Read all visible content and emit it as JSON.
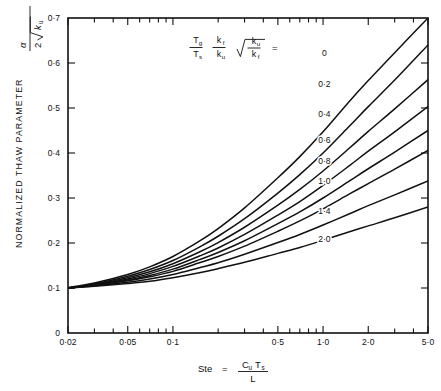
{
  "figure": {
    "yaxis_name": "NORMALIZED THAW PARAMETER",
    "yaxis_formula": {
      "numerator": "α",
      "denominator_coef": "2",
      "denominator_radicand": "k",
      "denominator_radicand_sub": "u"
    },
    "xaxis_caption": {
      "symbol": "Ste",
      "equals": "=",
      "numerator_a": "C",
      "numerator_a_sub": "u",
      "numerator_b": "T",
      "numerator_b_sub": "s",
      "denominator": "L"
    },
    "legend_formula": {
      "t_num": "T",
      "t_num_sub": "g",
      "t_den": "T",
      "t_den_sub": "s",
      "k_num": "k",
      "k_num_sub": "f",
      "k_den": "k",
      "k_den_sub": "u",
      "root_num": "k",
      "root_num_sub": "u",
      "root_den": "k",
      "root_den_sub": "f",
      "equals": "="
    }
  },
  "chart_data": {
    "type": "line",
    "title": "",
    "xlabel": "Ste = Cu Ts / L",
    "ylabel": "NORMALIZED THAW PARAMETER  α / (2√ku)",
    "xscale": "log",
    "xlim": [
      0.02,
      5.0
    ],
    "ylim": [
      0,
      0.7
    ],
    "grid": false,
    "legend_position": "inline-curve-labels",
    "xticks_labeled": [
      "0·02",
      "0·05",
      "0·1",
      "0·5",
      "1·0",
      "2·0",
      "5·0"
    ],
    "xticks_values": [
      0.02,
      0.05,
      0.1,
      0.5,
      1.0,
      2.0,
      5.0
    ],
    "xticks_minor": [
      0.03,
      0.04,
      0.06,
      0.07,
      0.08,
      0.09,
      0.2,
      0.3,
      0.4,
      0.6,
      0.7,
      0.8,
      0.9,
      3.0,
      4.0
    ],
    "yticks_labeled": [
      "0",
      "0·1",
      "0·2",
      "0·3",
      "0·4",
      "0·5",
      "0·6",
      "0·7"
    ],
    "yticks_values": [
      0,
      0.1,
      0.2,
      0.3,
      0.4,
      0.5,
      0.6,
      0.7
    ],
    "series": [
      {
        "name": "0",
        "label": "0",
        "label_x": 1.02,
        "label_y": 0.622,
        "x": [
          0.02,
          0.03,
          0.05,
          0.07,
          0.1,
          0.15,
          0.2,
          0.3,
          0.5,
          0.7,
          1.0,
          1.5,
          2.0,
          3.0,
          5.0
        ],
        "y": [
          0.101,
          0.111,
          0.13,
          0.147,
          0.17,
          0.204,
          0.232,
          0.278,
          0.345,
          0.392,
          0.447,
          0.515,
          0.561,
          0.623,
          0.7
        ]
      },
      {
        "name": "0.2",
        "label": "0·2",
        "label_x": 1.02,
        "label_y": 0.553,
        "x": [
          0.02,
          0.03,
          0.05,
          0.07,
          0.1,
          0.15,
          0.2,
          0.3,
          0.5,
          0.7,
          1.0,
          1.5,
          2.0,
          3.0,
          5.0
        ],
        "y": [
          0.1,
          0.109,
          0.126,
          0.141,
          0.161,
          0.191,
          0.215,
          0.254,
          0.311,
          0.352,
          0.4,
          0.46,
          0.503,
          0.562,
          0.64
        ]
      },
      {
        "name": "0.4",
        "label": "0·4",
        "label_x": 1.02,
        "label_y": 0.487,
        "x": [
          0.02,
          0.03,
          0.05,
          0.07,
          0.1,
          0.15,
          0.2,
          0.3,
          0.5,
          0.7,
          1.0,
          1.5,
          2.0,
          3.0,
          5.0
        ],
        "y": [
          0.1,
          0.108,
          0.123,
          0.136,
          0.154,
          0.18,
          0.201,
          0.235,
          0.284,
          0.319,
          0.36,
          0.411,
          0.448,
          0.498,
          0.563
        ]
      },
      {
        "name": "0.6",
        "label": "0·6",
        "label_x": 1.02,
        "label_y": 0.43,
        "x": [
          0.02,
          0.03,
          0.05,
          0.07,
          0.1,
          0.15,
          0.2,
          0.3,
          0.5,
          0.7,
          1.0,
          1.5,
          2.0,
          3.0,
          5.0
        ],
        "y": [
          0.1,
          0.107,
          0.12,
          0.132,
          0.148,
          0.171,
          0.189,
          0.219,
          0.262,
          0.292,
          0.328,
          0.372,
          0.404,
          0.447,
          0.503
        ]
      },
      {
        "name": "0.8",
        "label": "0·8",
        "label_x": 1.02,
        "label_y": 0.382,
        "x": [
          0.02,
          0.03,
          0.05,
          0.07,
          0.1,
          0.15,
          0.2,
          0.3,
          0.5,
          0.7,
          1.0,
          1.5,
          2.0,
          3.0,
          5.0
        ],
        "y": [
          0.1,
          0.106,
          0.118,
          0.128,
          0.142,
          0.163,
          0.179,
          0.205,
          0.243,
          0.269,
          0.3,
          0.338,
          0.365,
          0.402,
          0.45
        ]
      },
      {
        "name": "1.0",
        "label": "1·0",
        "label_x": 1.02,
        "label_y": 0.338,
        "x": [
          0.02,
          0.03,
          0.05,
          0.07,
          0.1,
          0.15,
          0.2,
          0.3,
          0.5,
          0.7,
          1.0,
          1.5,
          2.0,
          3.0,
          5.0
        ],
        "y": [
          0.1,
          0.106,
          0.116,
          0.125,
          0.137,
          0.156,
          0.17,
          0.193,
          0.226,
          0.249,
          0.276,
          0.309,
          0.332,
          0.364,
          0.406
        ]
      },
      {
        "name": "1.4",
        "label": "1·4",
        "label_x": 1.02,
        "label_y": 0.272,
        "x": [
          0.02,
          0.03,
          0.05,
          0.07,
          0.1,
          0.15,
          0.2,
          0.3,
          0.5,
          0.7,
          1.0,
          1.5,
          2.0,
          3.0,
          5.0
        ],
        "y": [
          0.1,
          0.105,
          0.113,
          0.12,
          0.13,
          0.145,
          0.156,
          0.175,
          0.201,
          0.219,
          0.24,
          0.265,
          0.283,
          0.307,
          0.338
        ]
      },
      {
        "name": "2.0",
        "label": "2·0",
        "label_x": 1.02,
        "label_y": 0.208,
        "x": [
          0.02,
          0.03,
          0.05,
          0.07,
          0.1,
          0.15,
          0.2,
          0.3,
          0.5,
          0.7,
          1.0,
          1.5,
          2.0,
          3.0,
          5.0
        ],
        "y": [
          0.1,
          0.104,
          0.11,
          0.115,
          0.123,
          0.134,
          0.143,
          0.157,
          0.177,
          0.19,
          0.206,
          0.225,
          0.238,
          0.256,
          0.28
        ]
      }
    ]
  }
}
